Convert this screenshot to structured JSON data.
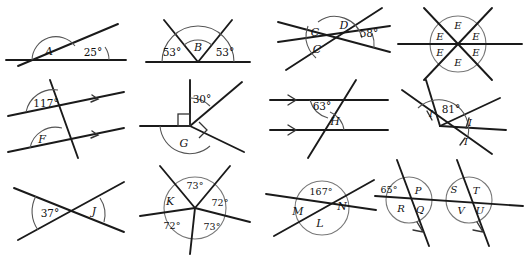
{
  "worksheet": {
    "title": "Angle diagrams worksheet",
    "description": "Twelve geometry figures showing angles at points, on straight lines, and with parallel lines.",
    "background_color": "#ffffff",
    "ink_color": "#1a1a1a"
  },
  "figures": [
    {
      "id": "figure-a",
      "name": "angles-on-a-straight-line-A",
      "description": "A ray from a point on a horizontal straight line creates a 25 degree angle; angle A is the remaining angle.",
      "labels": [
        {
          "key": "A",
          "text": "A",
          "kind": "unknown-angle"
        },
        {
          "key": "a25",
          "text": "25°",
          "kind": "known-angle"
        }
      ]
    },
    {
      "id": "figure-b",
      "name": "angles-on-a-straight-line-B",
      "description": "Two rays from a point on a straight line; angles of 53 degrees on each side with angle B between them.",
      "labels": [
        {
          "key": "left53",
          "text": "53°",
          "kind": "known-angle"
        },
        {
          "key": "B",
          "text": "B",
          "kind": "unknown-angle"
        },
        {
          "key": "right53",
          "text": "53°",
          "kind": "known-angle"
        }
      ]
    },
    {
      "id": "figure-c-d",
      "name": "angles-at-a-point-C-D",
      "description": "Three straight lines crossing at one point; 58 degrees marked, angle D above and two equal angles C on the left.",
      "labels": [
        {
          "key": "C1",
          "text": "C",
          "kind": "unknown-angle"
        },
        {
          "key": "C2",
          "text": "C",
          "kind": "unknown-angle"
        },
        {
          "key": "D",
          "text": "D",
          "kind": "unknown-angle"
        },
        {
          "key": "a58",
          "text": "58°",
          "kind": "known-angle"
        }
      ]
    },
    {
      "id": "figure-e",
      "name": "six-equal-angles-at-a-point-E",
      "description": "Three straight lines through one point dividing the full turn into six equal angles, each labelled E, with a circle drawn around the point.",
      "labels": [
        {
          "key": "E1",
          "text": "E",
          "kind": "unknown-angle"
        },
        {
          "key": "E2",
          "text": "E",
          "kind": "unknown-angle"
        },
        {
          "key": "E3",
          "text": "E",
          "kind": "unknown-angle"
        },
        {
          "key": "E4",
          "text": "E",
          "kind": "unknown-angle"
        },
        {
          "key": "E5",
          "text": "E",
          "kind": "unknown-angle"
        },
        {
          "key": "E6",
          "text": "E",
          "kind": "unknown-angle"
        }
      ]
    },
    {
      "id": "figure-f",
      "name": "parallel-lines-transversal-F",
      "description": "A transversal crossing two parallel lines marked with single arrows; 117 degrees at the upper intersection, angle F at the lower intersection.",
      "labels": [
        {
          "key": "a117",
          "text": "117°",
          "kind": "known-angle"
        },
        {
          "key": "F",
          "text": "F",
          "kind": "unknown-angle"
        }
      ]
    },
    {
      "id": "figure-g",
      "name": "right-angles-and-30-degrees-G",
      "description": "A vertical ray and a horizontal ray meeting at a point with two right angle squares; 30 degrees between the vertical ray and a slanted ray, angle G below.",
      "labels": [
        {
          "key": "a30",
          "text": "30°",
          "kind": "known-angle"
        },
        {
          "key": "G",
          "text": "G",
          "kind": "unknown-angle"
        }
      ]
    },
    {
      "id": "figure-h",
      "name": "parallel-lines-transversal-H",
      "description": "A transversal crossing two parallel lines marked with single arrows; 63 degrees at the upper intersection, angle H at the lower intersection.",
      "labels": [
        {
          "key": "a63",
          "text": "63°",
          "kind": "known-angle"
        },
        {
          "key": "H",
          "text": "H",
          "kind": "unknown-angle"
        }
      ]
    },
    {
      "id": "figure-i",
      "name": "equal-angles-at-a-point-I",
      "description": "Several rays from a point with 81 degrees marked and three equal angles labelled I, each shown with a single tick mark.",
      "labels": [
        {
          "key": "I1",
          "text": "I",
          "kind": "unknown-angle"
        },
        {
          "key": "a81",
          "text": "81°",
          "kind": "known-angle"
        },
        {
          "key": "I2",
          "text": "I",
          "kind": "unknown-angle"
        },
        {
          "key": "I3",
          "text": "I",
          "kind": "unknown-angle"
        }
      ]
    },
    {
      "id": "figure-j",
      "name": "vertically-opposite-angles-J",
      "description": "Two straight lines crossing; 37 degrees on the left and angle J vertically opposite on the right.",
      "labels": [
        {
          "key": "a37",
          "text": "37°",
          "kind": "known-angle"
        },
        {
          "key": "J",
          "text": "J",
          "kind": "unknown-angle"
        }
      ]
    },
    {
      "id": "figure-k",
      "name": "angles-around-a-point-K",
      "description": "Five rays from a point inside a circle; angles of 73, 72, 73 and 72 degrees are given and angle K is unknown.",
      "labels": [
        {
          "key": "a73top",
          "text": "73°",
          "kind": "known-angle"
        },
        {
          "key": "K",
          "text": "K",
          "kind": "unknown-angle"
        },
        {
          "key": "a72right",
          "text": "72°",
          "kind": "known-angle"
        },
        {
          "key": "a72bottomleft",
          "text": "72°",
          "kind": "known-angle"
        },
        {
          "key": "a73bottomright",
          "text": "73°",
          "kind": "known-angle"
        }
      ]
    },
    {
      "id": "figure-l-m-n",
      "name": "vertically-opposite-angles-L-M-N",
      "description": "Two straight lines crossing inside a circle; 167 degrees at the top with angles M, N and L around the point.",
      "labels": [
        {
          "key": "a167",
          "text": "167°",
          "kind": "known-angle"
        },
        {
          "key": "M",
          "text": "M",
          "kind": "unknown-angle"
        },
        {
          "key": "N",
          "text": "N",
          "kind": "unknown-angle"
        },
        {
          "key": "L",
          "text": "L",
          "kind": "unknown-angle"
        }
      ]
    },
    {
      "id": "figure-p-u",
      "name": "parallel-transversals-P-to-U",
      "description": "Two parallel slanted lines marked with single arrows crossing one straight line; 65 degrees given, with angles P, Q, R at the first intersection and S, T, U, V at the second.",
      "labels": [
        {
          "key": "a65",
          "text": "65°",
          "kind": "known-angle"
        },
        {
          "key": "P",
          "text": "P",
          "kind": "unknown-angle"
        },
        {
          "key": "R",
          "text": "R",
          "kind": "unknown-angle"
        },
        {
          "key": "Q",
          "text": "Q",
          "kind": "unknown-angle"
        },
        {
          "key": "S",
          "text": "S",
          "kind": "unknown-angle"
        },
        {
          "key": "T",
          "text": "T",
          "kind": "unknown-angle"
        },
        {
          "key": "V",
          "text": "V",
          "kind": "unknown-angle"
        },
        {
          "key": "U",
          "text": "U",
          "kind": "unknown-angle"
        }
      ]
    }
  ]
}
